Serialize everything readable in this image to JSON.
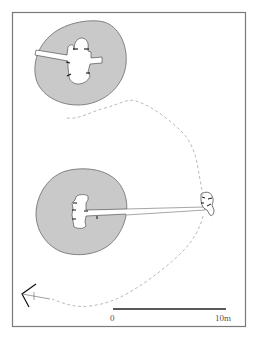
{
  "figure": {
    "type": "site-plan",
    "frame_color": "#7a7a7a",
    "mound_fill": "#c9c9c9",
    "mound_stroke": "#6a6a6a",
    "ditch_stroke": "#a8a8a8"
  },
  "features": [
    {
      "id": "mound-north",
      "label": "North mound with cruciform chamber"
    },
    {
      "id": "mound-south",
      "label": "South mound with chamber and long passage"
    },
    {
      "id": "small-structure-east",
      "label": "Small structure east"
    },
    {
      "id": "boundary-dashed",
      "label": "Dashed enclosure line"
    }
  ],
  "north_arrow": {
    "label": "North arrow"
  },
  "scale_bar": {
    "start_label": "0",
    "end_label": "10m",
    "color": "#222222"
  }
}
